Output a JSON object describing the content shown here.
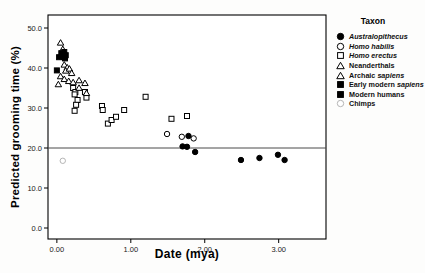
{
  "chart_data": {
    "type": "scatter",
    "title": "",
    "xlabel": "Date (mya)",
    "ylabel": "Predicted grooming time (%)",
    "xlim": [
      -0.12,
      3.64
    ],
    "ylim": [
      -2.75,
      53.25
    ],
    "xticks": [
      0.0,
      1.0,
      2.0,
      3.0
    ],
    "xtick_labels": [
      "0.00",
      "1.00",
      "2.00",
      "3.00"
    ],
    "yticks": [
      0,
      10,
      20,
      30,
      40,
      50
    ],
    "ytick_labels": [
      "0.0",
      "10.0",
      "20.0",
      "30.0",
      "40.0",
      "50.0"
    ],
    "grid": "off",
    "reference_line_y": 20.0,
    "legend_title": "Taxon",
    "legend_position": "outside-right-top",
    "marker_color": "#000000",
    "chimp_color": "#b5b5b5",
    "series": [
      {
        "name": "Australopithecus",
        "marker": "circle",
        "fill": "filled",
        "color": "#000000",
        "italic": "all",
        "points": [
          [
            1.78,
            23.0
          ],
          [
            1.7,
            20.4
          ],
          [
            1.76,
            20.3
          ],
          [
            1.87,
            19.0
          ],
          [
            2.49,
            17.0
          ],
          [
            2.74,
            17.5
          ],
          [
            2.99,
            18.3
          ],
          [
            3.08,
            17.0
          ]
        ]
      },
      {
        "name": "Homo habilis",
        "marker": "circle",
        "fill": "open",
        "color": "#000000",
        "italic": "all",
        "points": [
          [
            1.49,
            23.5
          ],
          [
            1.69,
            22.8
          ],
          [
            1.85,
            22.4
          ]
        ]
      },
      {
        "name": "Homo erectus",
        "marker": "square",
        "fill": "open",
        "color": "#000000",
        "italic": "all",
        "points": [
          [
            0.22,
            35.0
          ],
          [
            0.25,
            34.0
          ],
          [
            0.38,
            34.0
          ],
          [
            0.24,
            33.4
          ],
          [
            0.28,
            32.0
          ],
          [
            0.4,
            32.6
          ],
          [
            0.26,
            30.8
          ],
          [
            0.24,
            29.3
          ],
          [
            0.61,
            30.5
          ],
          [
            0.62,
            29.5
          ],
          [
            0.91,
            29.5
          ],
          [
            0.69,
            26.1
          ],
          [
            0.74,
            27.0
          ],
          [
            0.8,
            27.8
          ],
          [
            1.2,
            32.8
          ],
          [
            1.55,
            27.3
          ],
          [
            1.76,
            28.0
          ]
        ]
      },
      {
        "name": "Neanderthals",
        "marker": "triangle",
        "fill": "open",
        "color": "#000000",
        "italic": "none",
        "points": [
          [
            0.05,
            46.4
          ],
          [
            0.08,
            44.8
          ],
          [
            0.1,
            40.9
          ],
          [
            0.14,
            40.2
          ],
          [
            0.12,
            39.4
          ],
          [
            0.17,
            39.9
          ],
          [
            0.2,
            38.8
          ],
          [
            0.05,
            38.0
          ]
        ]
      },
      {
        "name": "Archaic sapiens",
        "marker": "triangle",
        "fill": "open",
        "color": "#000000",
        "italic": "last",
        "points": [
          [
            0.1,
            37.3
          ],
          [
            0.16,
            36.8
          ],
          [
            0.02,
            36.0
          ],
          [
            0.22,
            36.5
          ],
          [
            0.3,
            37.0
          ],
          [
            0.38,
            36.3
          ],
          [
            0.3,
            35.1
          ],
          [
            0.4,
            33.8
          ]
        ]
      },
      {
        "name": "Early modern sapiens",
        "marker": "square",
        "fill": "filled",
        "color": "#000000",
        "italic": "last",
        "points": [
          [
            0.06,
            43.7
          ],
          [
            0.1,
            44.0
          ],
          [
            0.12,
            43.2
          ],
          [
            0.07,
            42.9
          ],
          [
            0.11,
            42.4
          ],
          [
            0.09,
            43.4
          ]
        ]
      },
      {
        "name": "Modern humans",
        "marker": "square",
        "fill": "filled",
        "color": "#000000",
        "italic": "none",
        "points": [
          [
            0.0,
            39.4
          ],
          [
            0.03,
            42.7
          ]
        ]
      },
      {
        "name": "Chimps",
        "marker": "circle",
        "fill": "open",
        "color": "#b5b5b5",
        "italic": "none",
        "points": [
          [
            0.08,
            16.8
          ]
        ]
      }
    ]
  }
}
